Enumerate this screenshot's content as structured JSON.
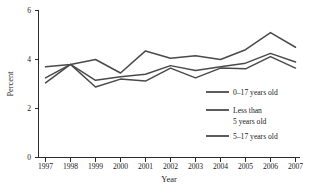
{
  "chart_data": {
    "type": "line",
    "title": "",
    "subtitle": "",
    "xlabel": "Year",
    "ylabel": "Percent",
    "x": [
      1997,
      1998,
      1999,
      2000,
      2001,
      2002,
      2003,
      2004,
      2005,
      2006,
      2007
    ],
    "categories": [
      "1997",
      "1998",
      "1999",
      "2000",
      "2001",
      "2002",
      "2003",
      "2004",
      "2005",
      "2006",
      "2007"
    ],
    "xlim": [
      1997,
      2007
    ],
    "ylim": [
      0,
      6
    ],
    "yticks": [
      0,
      2,
      4,
      6
    ],
    "ytick_labels": [
      "0",
      "2",
      "4",
      "6"
    ],
    "grid": false,
    "legend_position": "inside-lower-right",
    "series": [
      {
        "name": "0–17 years old",
        "color": "#4a4a4a",
        "values": [
          3.7,
          3.8,
          4.0,
          3.45,
          4.35,
          4.05,
          4.15,
          4.0,
          4.4,
          5.1,
          4.5
        ]
      },
      {
        "name": "Less than\n5 years old",
        "color": "#4a4a4a",
        "values": [
          3.25,
          3.8,
          3.15,
          3.3,
          3.4,
          3.75,
          3.55,
          3.7,
          3.85,
          4.25,
          3.9
        ]
      },
      {
        "name": "5–17 years old",
        "color": "#4a4a4a",
        "values": [
          3.05,
          3.8,
          2.88,
          3.2,
          3.12,
          3.65,
          3.25,
          3.65,
          3.62,
          4.12,
          3.65
        ]
      }
    ]
  },
  "axes": {
    "y_label": "Percent",
    "x_label": "Year",
    "y_ticks": [
      "6",
      "4",
      "2",
      "0"
    ],
    "x_ticks": [
      "1997",
      "1998",
      "1999",
      "2000",
      "2001",
      "2002",
      "2003",
      "2004",
      "2005",
      "2006",
      "2007"
    ]
  },
  "legend": {
    "items": [
      {
        "label": "0–17 years old",
        "line2": ""
      },
      {
        "label": "Less than",
        "line2": "5 years old"
      },
      {
        "label": "5–17 years old",
        "line2": ""
      }
    ]
  },
  "colors": {
    "series_stroke": "#4a4a4a",
    "axis": "#2b2b2b",
    "text": "#1a1a1a",
    "background": "#ffffff"
  }
}
